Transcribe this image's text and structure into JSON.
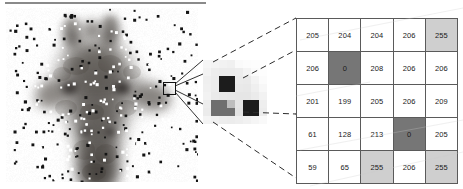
{
  "figure": {
    "top_rule_color": "#8a8a8a"
  },
  "photo": {
    "subject": "giraffe-head-photograph",
    "noise_type": "salt-and-pepper",
    "background_color": "#fdfdfd",
    "roi_label": "selected-pixel-region"
  },
  "patch": {
    "label": "magnified-pixel-patch",
    "cols": 8,
    "rows": 8,
    "pixels": [
      [
        "#f6f6f6",
        "#f4f4f4",
        "#f2f2f2",
        "#f0f0f0",
        "#fafafa",
        "#fcfcfc",
        "#fdfdfd",
        "#fdfdfd"
      ],
      [
        "#f3f3f3",
        "#ededed",
        "#ebebeb",
        "#ebebeb",
        "#ededed",
        "#f4f4f4",
        "#fbfbfb",
        "#fdfdfd"
      ],
      [
        "#efefef",
        "#ececec",
        "#1c1c1c",
        "#1c1c1c",
        "#ebebeb",
        "#eaeaea",
        "#f3f3f3",
        "#fbfbfb"
      ],
      [
        "#f0f0f0",
        "#ececec",
        "#1c1c1c",
        "#1c1c1c",
        "#e9e9e9",
        "#e8e8e8",
        "#efefef",
        "#f7f7f7"
      ],
      [
        "#f2f2f2",
        "#eaeaea",
        "#e8e8e8",
        "#e7e7e7",
        "#e6e6e6",
        "#e6e6e6",
        "#ebebeb",
        "#f2f2f2"
      ],
      [
        "#ededed",
        "#6e6e6e",
        "#6e6e6e",
        "#bdbdbd",
        "#e4e4e4",
        "#1c1c1c",
        "#1c1c1c",
        "#eeeeee"
      ],
      [
        "#ebebeb",
        "#6e6e6e",
        "#6e6e6e",
        "#6e6e6e",
        "#e2e2e2",
        "#1c1c1c",
        "#1c1c1c",
        "#ececec"
      ],
      [
        "#f4f4f4",
        "#f0f0f0",
        "#ededed",
        "#ececec",
        "#eeeeee",
        "#f1f1f1",
        "#f5f5f5",
        "#f9f9f9"
      ]
    ]
  },
  "table": {
    "label": "pixel-value-matrix",
    "rows": 5,
    "cols": 5,
    "cells": [
      [
        {
          "value": "205",
          "shade": "shade-white"
        },
        {
          "value": "204",
          "shade": "shade-white"
        },
        {
          "value": "204",
          "shade": "shade-white"
        },
        {
          "value": "206",
          "shade": "shade-white"
        },
        {
          "value": "255",
          "shade": "shade-light"
        }
      ],
      [
        {
          "value": "206",
          "shade": "shade-white"
        },
        {
          "value": "0",
          "shade": "shade-dark"
        },
        {
          "value": "208",
          "shade": "shade-white"
        },
        {
          "value": "206",
          "shade": "shade-white"
        },
        {
          "value": "206",
          "shade": "shade-white"
        }
      ],
      [
        {
          "value": "201",
          "shade": "shade-white"
        },
        {
          "value": "199",
          "shade": "shade-white"
        },
        {
          "value": "205",
          "shade": "shade-white"
        },
        {
          "value": "206",
          "shade": "shade-white"
        },
        {
          "value": "209",
          "shade": "shade-white"
        }
      ],
      [
        {
          "value": "61",
          "shade": "shade-white"
        },
        {
          "value": "128",
          "shade": "shade-white"
        },
        {
          "value": "213",
          "shade": "shade-white"
        },
        {
          "value": "0",
          "shade": "shade-dark"
        },
        {
          "value": "205",
          "shade": "shade-white"
        }
      ],
      [
        {
          "value": "59",
          "shade": "shade-white"
        },
        {
          "value": "65",
          "shade": "shade-white"
        },
        {
          "value": "255",
          "shade": "shade-light"
        },
        {
          "value": "206",
          "shade": "shade-white"
        },
        {
          "value": "255",
          "shade": "shade-light"
        }
      ]
    ],
    "shade_colors": {
      "shade-white": "#ffffff",
      "shade-light": "#cfcfcf",
      "shade-dark": "#767676"
    },
    "border_color": "#5a5a5a"
  },
  "connectors": {
    "ray_label": "roi-to-patch-ray",
    "dash_label": "patch-to-table-dashed-line",
    "ray_color": "#1a1a1a",
    "dash_color": "#2b2b2b"
  }
}
